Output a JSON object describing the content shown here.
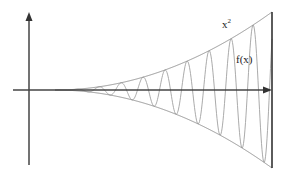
{
  "chart_data": {
    "type": "line",
    "title": "",
    "xlabel": "",
    "ylabel": "",
    "grid": false,
    "series": [
      {
        "name": "x^2",
        "description": "upper envelope",
        "function": "x^2"
      },
      {
        "name": "-x^2",
        "description": "lower envelope",
        "function": "-x^2"
      },
      {
        "name": "f(x)",
        "description": "oscillating function bounded by ±x^2",
        "function": "x^2 * sin(kx)"
      }
    ],
    "annotations": [
      {
        "text": "x",
        "superscript": "2",
        "x": 222,
        "y": 18
      },
      {
        "text": "f(x)",
        "x": 236,
        "y": 54
      }
    ],
    "geometry": {
      "origin_px": [
        29,
        90
      ],
      "envelope_start_px": 55,
      "envelope_end_px": 272,
      "envelope_amp_px": 78,
      "period_px": 22,
      "yaxis_top_px": 12,
      "yaxis_bottom_px": 165,
      "xaxis_left_px": 13,
      "xaxis_right_px": 272,
      "right_line_x_px": 272,
      "right_line_top_px": 12,
      "right_line_bottom_px": 168
    }
  },
  "labels": {
    "upper": "x",
    "upper_sup": "2",
    "func": "f(x)"
  },
  "colors": {
    "axis": "#444444",
    "curve": "#9a9a9a",
    "envelope": "#888888"
  }
}
